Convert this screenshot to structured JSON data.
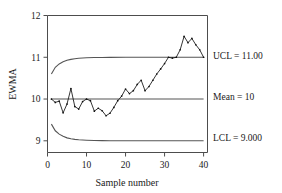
{
  "chart_data": {
    "type": "line",
    "title": "",
    "subtitle": "",
    "xlabel": "Sample number",
    "ylabel": "EWMA",
    "xlim": [
      0,
      41
    ],
    "ylim": [
      8.72,
      12.0
    ],
    "grid": false,
    "legend_position": "right-outside",
    "xticks": [
      0,
      10,
      20,
      30,
      40
    ],
    "xtick_labels": [
      "0",
      "10",
      "20",
      "30",
      "40"
    ],
    "yticks": [
      9,
      10,
      11,
      12
    ],
    "ytick_labels": [
      "9",
      "10",
      "11",
      "12"
    ],
    "annotations": [
      {
        "name": "ucl-label",
        "text": "UCL = 11.00",
        "value": 11.0
      },
      {
        "name": "mean-label",
        "text": "Mean = 10",
        "value": 10.0
      },
      {
        "name": "lcl-label",
        "text": "LCL = 9.000",
        "value": 9.0
      }
    ],
    "series": [
      {
        "name": "EWMA",
        "marker": "dot",
        "x": [
          1,
          2,
          3,
          4,
          5,
          6,
          7,
          8,
          9,
          10,
          11,
          12,
          13,
          14,
          15,
          16,
          17,
          18,
          19,
          20,
          21,
          22,
          23,
          24,
          25,
          26,
          27,
          28,
          29,
          30,
          31,
          32,
          33,
          34,
          35,
          36,
          37,
          38,
          39,
          40
        ],
        "values": [
          10.0,
          9.92,
          9.95,
          9.67,
          9.88,
          10.25,
          9.82,
          9.76,
          9.94,
          10.0,
          9.96,
          9.71,
          9.78,
          9.72,
          9.6,
          9.66,
          9.8,
          9.96,
          10.07,
          10.24,
          10.13,
          10.2,
          10.35,
          10.45,
          10.2,
          10.3,
          10.45,
          10.6,
          10.72,
          10.85,
          11.0,
          10.98,
          11.0,
          11.18,
          11.5,
          11.35,
          11.45,
          11.3,
          11.18,
          11.0
        ]
      },
      {
        "name": "UCL",
        "marker": "none",
        "x": [
          1,
          2,
          3,
          4,
          5,
          6,
          7,
          8,
          9,
          10,
          12,
          14,
          16,
          20,
          25,
          30,
          35,
          40
        ],
        "values": [
          10.6,
          10.76,
          10.84,
          10.89,
          10.93,
          10.95,
          10.965,
          10.975,
          10.982,
          10.987,
          10.993,
          10.996,
          10.998,
          11.0,
          11.0,
          11.0,
          11.0,
          11.0
        ]
      },
      {
        "name": "Mean",
        "marker": "none",
        "x": [
          1,
          40
        ],
        "values": [
          10.0,
          10.0
        ]
      },
      {
        "name": "LCL",
        "marker": "none",
        "x": [
          1,
          2,
          3,
          4,
          5,
          6,
          7,
          8,
          9,
          10,
          12,
          14,
          16,
          20,
          25,
          30,
          35,
          40
        ],
        "values": [
          9.4,
          9.24,
          9.16,
          9.11,
          9.07,
          9.05,
          9.035,
          9.025,
          9.018,
          9.013,
          9.007,
          9.004,
          9.002,
          9.0,
          9.0,
          9.0,
          9.0,
          9.0
        ]
      }
    ]
  },
  "colors": {
    "series": "#111111",
    "limits": "#555555",
    "axis": "#4d4d4d",
    "background": "#ffffff"
  }
}
